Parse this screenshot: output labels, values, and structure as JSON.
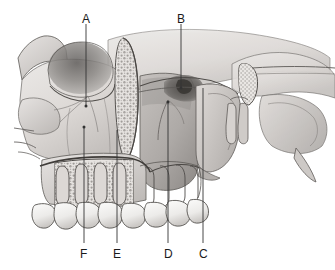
{
  "figure": {
    "type": "anatomical-illustration",
    "style": "grayscale medical line drawing with airbrush shading",
    "background_color": "#ffffff",
    "line_color": "#4a4a4a",
    "leader_color": "#3a3a3a",
    "bone_fill_light": "#e8e6e4",
    "bone_fill_mid": "#cfccc9",
    "bone_fill_dark": "#a9a5a2",
    "shadow_color": "#8e8a87",
    "tooth_fill": "#f2f1ef"
  },
  "labels": [
    {
      "id": "A",
      "text": "A",
      "position": "top-left",
      "x": 86,
      "y": 22,
      "leader": {
        "x1": 86,
        "y1": 24,
        "x2": 86,
        "y2": 106
      },
      "target": "infraorbital-rim-region"
    },
    {
      "id": "B",
      "text": "B",
      "position": "top-right",
      "x": 181,
      "y": 22,
      "leader": {
        "x1": 181,
        "y1": 24,
        "x2": 181,
        "y2": 88
      },
      "target": "pterygomaxillary-fissure-region"
    },
    {
      "id": "C",
      "text": "C",
      "position": "bottom-right",
      "x": 203,
      "y": 255,
      "leader": {
        "x1": 203,
        "y1": 243,
        "x2": 203,
        "y2": 88
      },
      "target": "pterygoid-plate-region"
    },
    {
      "id": "D",
      "text": "D",
      "position": "bottom",
      "x": 168,
      "y": 255,
      "leader": {
        "x1": 168,
        "y1": 243,
        "x2": 168,
        "y2": 102
      },
      "target": "maxillary-sinus-region"
    },
    {
      "id": "E",
      "text": "E",
      "position": "bottom-left",
      "x": 117,
      "y": 255,
      "leader": {
        "x1": 117,
        "y1": 243,
        "x2": 117,
        "y2": 130
      },
      "target": "nasal-cavity-concha-region"
    },
    {
      "id": "F",
      "text": "F",
      "position": "bottom-left",
      "x": 84,
      "y": 255,
      "leader": {
        "x1": 84,
        "y1": 243,
        "x2": 84,
        "y2": 127
      },
      "target": "anterior-maxilla-alveolar-region"
    }
  ]
}
